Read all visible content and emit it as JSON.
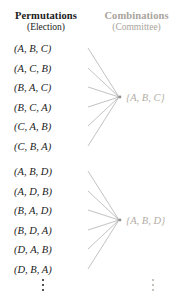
{
  "figure": {
    "name": "permutations-vs-combinations-mapping",
    "columns": {
      "left": {
        "title": "Permutations",
        "subtitle": "(Election)",
        "color": "#1a1a1a"
      },
      "right": {
        "title": "Combinations",
        "subtitle": "(Committee)",
        "color": "#a9a49b"
      }
    },
    "groups": [
      {
        "combination": "{A, B, C}",
        "permutations": [
          "(A, B, C)",
          "(A, C, B)",
          "(B, A, C)",
          "(B, C, A)",
          "(C, A, B)",
          "(C, B, A)"
        ]
      },
      {
        "combination": "{A, B, D}",
        "permutations": [
          "(A, B, D)",
          "(A, D, B)",
          "(B, A, D)",
          "(B, D, A)",
          "(D, A, B)",
          "(D, B, A)"
        ]
      }
    ],
    "ellipsis": {
      "left": "⋮",
      "right": "⋮"
    },
    "link_color": "#a7a7a7"
  }
}
